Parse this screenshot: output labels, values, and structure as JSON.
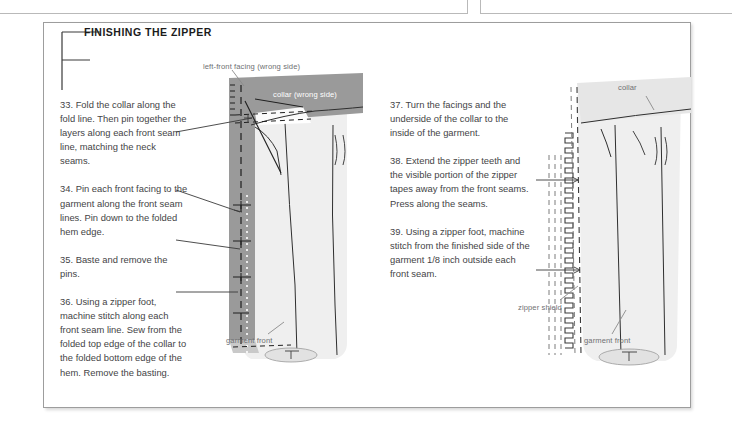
{
  "page": {
    "frame_border_color": "#9d9d9d",
    "text_color": "#444446",
    "label_color": "#6f7073",
    "collar_fill": "#9a9a9a",
    "garment_fill": "#efefef"
  },
  "header": {
    "dropcap": "F",
    "title": "FINISHING THE ZIPPER"
  },
  "steps_left": [
    {
      "number": "33.",
      "text": "33. Fold the collar along the fold line. Then pin together the layers along each front seam line, matching the neck seams."
    },
    {
      "number": "34.",
      "text": "34. Pin each front facing to the garment along the front seam lines. Pin down to the folded hem edge."
    },
    {
      "number": "35.",
      "text": "35. Baste and remove the pins."
    },
    {
      "number": "36.",
      "text": "36. Using a zipper foot, machine stitch along each front seam line. Sew from the folded top edge of the collar to the folded bottom edge of the hem. Remove the basting."
    }
  ],
  "steps_right": [
    {
      "number": "37.",
      "text": "37. Turn the facings and the underside of the collar to the inside of the garment."
    },
    {
      "number": "38.",
      "text": "38. Extend the zipper teeth and the visible portion of the zipper tapes away from the front seams. Press along the seams."
    },
    {
      "number": "39.",
      "text": "39. Using a zipper foot, machine stitch from the finished side of the garment 1/8 inch outside each front seam."
    }
  ],
  "illustration_left": {
    "labels": {
      "facing": "left-front facing (wrong side)",
      "collar": "collar (wrong side)",
      "garment_front": "garment front"
    }
  },
  "illustration_right": {
    "labels": {
      "collar": "collar",
      "zipper_shield": "zipper shield",
      "garment_front": "garment front"
    }
  }
}
